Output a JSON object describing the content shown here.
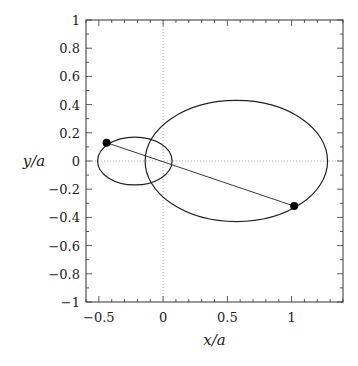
{
  "chart_data": {
    "type": "line",
    "title": "",
    "xlabel": "x/a",
    "ylabel": "y/a",
    "xlim": [
      -0.6,
      1.4
    ],
    "ylim": [
      -1,
      1
    ],
    "x_ticks": [
      {
        "value": -0.5,
        "label": "−0.5"
      },
      {
        "value": 0,
        "label": "0"
      },
      {
        "value": 0.5,
        "label": "0.5"
      },
      {
        "value": 1,
        "label": "1"
      }
    ],
    "y_ticks": [
      {
        "value": 1,
        "label": "1"
      },
      {
        "value": 0.8,
        "label": "0.8"
      },
      {
        "value": 0.6,
        "label": "0.6"
      },
      {
        "value": 0.4,
        "label": "0.4"
      },
      {
        "value": 0.2,
        "label": "0.2"
      },
      {
        "value": 0,
        "label": "0"
      },
      {
        "value": -0.2,
        "label": "−0.2"
      },
      {
        "value": -0.4,
        "label": "−0.4"
      },
      {
        "value": -0.6,
        "label": "−0.6"
      },
      {
        "value": -0.8,
        "label": "−0.8"
      },
      {
        "value": -1,
        "label": "−1"
      }
    ],
    "grid": false,
    "reference_lines": {
      "x0_dotted": true,
      "y0_dotted": true
    },
    "series": [
      {
        "name": "small orbit",
        "shape": "ellipse",
        "center": [
          -0.22,
          0.0
        ],
        "semi_axes": [
          0.29,
          0.17
        ]
      },
      {
        "name": "large orbit",
        "shape": "ellipse",
        "center": [
          0.57,
          0.0
        ],
        "semi_axes": [
          0.71,
          0.43
        ]
      },
      {
        "name": "connecting line",
        "shape": "segment",
        "points": [
          [
            -0.44,
            0.13
          ],
          [
            1.02,
            -0.32
          ]
        ]
      },
      {
        "name": "bodies",
        "shape": "points",
        "points": [
          [
            -0.44,
            0.13
          ],
          [
            1.02,
            -0.32
          ]
        ]
      }
    ],
    "legend": null
  }
}
